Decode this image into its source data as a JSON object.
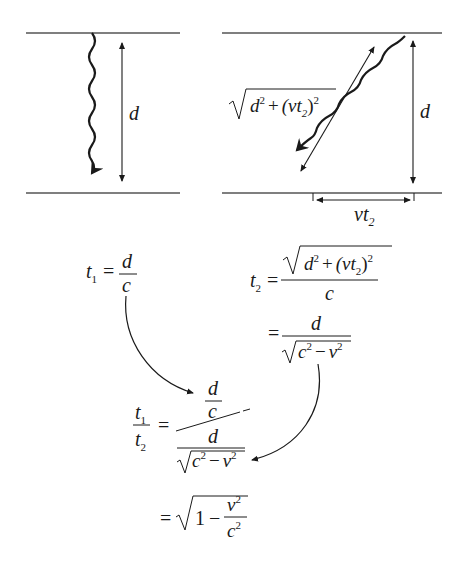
{
  "left_panel": {
    "label_d": "d"
  },
  "right_panel": {
    "label_d": "d",
    "hyp_label": {
      "sqrt_inner_d": "d",
      "sq": "2",
      "plus": "+",
      "paren": "(vt",
      "sub": "2",
      "close": ")",
      "sq2": "2"
    },
    "base_label": {
      "v": "vt",
      "sub": "2"
    }
  },
  "equations": {
    "t1": {
      "lhs": "t",
      "sub": "1",
      "eq": "=",
      "num": "d",
      "den": "c"
    },
    "t2": {
      "lhs": "t",
      "sub": "2",
      "eq": "=",
      "num_d": "d",
      "num_sq": "2",
      "num_plus": "+",
      "num_paren": "(vt",
      "num_sub": "2",
      "num_close": ")",
      "num_sq2": "2",
      "den": "c"
    },
    "t2_simplified": {
      "eq": "=",
      "num": "d",
      "den_c": "c",
      "den_sq": "2",
      "den_minus": "−",
      "den_v": "v",
      "den_sq2": "2"
    },
    "ratio": {
      "lhs_num": "t",
      "lhs_num_sub": "1",
      "lhs_den": "t",
      "lhs_den_sub": "2",
      "eq": "=",
      "top_num": "d",
      "top_den": "c",
      "bot_num": "d",
      "bot_c": "c",
      "bot_sq": "2",
      "bot_minus": "−",
      "bot_v": "v",
      "bot_sq2": "2"
    },
    "result": {
      "eq": "=",
      "one": "1",
      "minus": "−",
      "num": "v",
      "num_sq": "2",
      "den": "c",
      "den_sq": "2"
    }
  }
}
